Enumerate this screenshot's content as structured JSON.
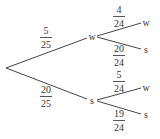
{
  "diagram": {
    "type": "probability-tree",
    "root": {
      "x": 6,
      "y": 68
    },
    "first_level": [
      {
        "label": "w",
        "node": {
          "x": 92,
          "y": 37
        },
        "line_end": {
          "x": 87,
          "y": 38
        },
        "probability": {
          "numerator": "5",
          "denominator": "25",
          "x": 46,
          "y": 26
        },
        "children": [
          {
            "label": "w",
            "node": {
              "x": 146,
              "y": 23
            },
            "line_start": {
              "x": 97,
              "y": 36
            },
            "line_end": {
              "x": 141,
              "y": 23
            },
            "probability": {
              "numerator": "4",
              "denominator": "24",
              "x": 119,
              "y": 5
            }
          },
          {
            "label": "s",
            "node": {
              "x": 146,
              "y": 50
            },
            "line_start": {
              "x": 97,
              "y": 37
            },
            "line_end": {
              "x": 141,
              "y": 49
            },
            "probability": {
              "numerator": "20",
              "denominator": "24",
              "x": 119,
              "y": 44
            }
          }
        ]
      },
      {
        "label": "s",
        "node": {
          "x": 92,
          "y": 101
        },
        "line_end": {
          "x": 87,
          "y": 99
        },
        "probability": {
          "numerator": "20",
          "denominator": "25",
          "x": 46,
          "y": 85
        },
        "children": [
          {
            "label": "w",
            "node": {
              "x": 146,
              "y": 88
            },
            "line_start": {
              "x": 97,
              "y": 100
            },
            "line_end": {
              "x": 141,
              "y": 88
            },
            "probability": {
              "numerator": "5",
              "denominator": "24",
              "x": 119,
              "y": 70
            }
          },
          {
            "label": "s",
            "node": {
              "x": 146,
              "y": 115
            },
            "line_start": {
              "x": 97,
              "y": 101
            },
            "line_end": {
              "x": 141,
              "y": 114
            },
            "probability": {
              "numerator": "19",
              "denominator": "24",
              "x": 119,
              "y": 109
            }
          }
        ]
      }
    ]
  },
  "colors": {
    "line": "#444444",
    "text": "#333333",
    "background": "#ffffff"
  }
}
